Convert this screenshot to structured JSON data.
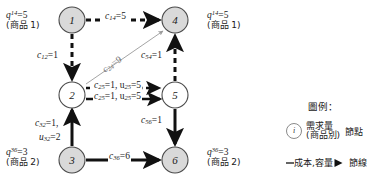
{
  "diagram": {
    "title_alt": "multi-commodity network flow diagram",
    "nodes": [
      {
        "id": "n1",
        "label": "1",
        "x": 72,
        "y": 20,
        "fill": "#d9d9d9"
      },
      {
        "id": "n4",
        "label": "4",
        "x": 175,
        "y": 20,
        "fill": "#d9d9d9"
      },
      {
        "id": "n2",
        "label": "2",
        "x": 72,
        "y": 95,
        "fill": "#ffffff"
      },
      {
        "id": "n5",
        "label": "5",
        "x": 175,
        "y": 95,
        "fill": "#ffffff"
      },
      {
        "id": "n3",
        "label": "3",
        "x": 72,
        "y": 160,
        "fill": "#d9d9d9"
      },
      {
        "id": "n6",
        "label": "6",
        "x": 175,
        "y": 160,
        "fill": "#d9d9d9"
      }
    ],
    "supplies": [
      {
        "name": "supply-1-4",
        "line1_q": "q",
        "line1_sup": "14",
        "line1_val": "=5",
        "line2": "(商品 1)",
        "x": 6,
        "y": 10
      },
      {
        "name": "supply-4-top-right",
        "line1_q": "q",
        "line1_sup": "14",
        "line1_val": "=5",
        "line2": "(商品 1)",
        "x": 207,
        "y": 10
      },
      {
        "name": "supply-3-6",
        "line1_q": "q",
        "line1_sup": "36",
        "line1_val": "=3",
        "line2": "(商品 2)",
        "x": 6,
        "y": 147
      },
      {
        "name": "supply-6-bottom-right",
        "line1_q": "q",
        "line1_sup": "36",
        "line1_val": "=3",
        "line2": "(商品 2)",
        "x": 207,
        "y": 147
      }
    ],
    "edge_labels": [
      {
        "name": "edge-label-c14",
        "text_c": "c",
        "sub": "14",
        "rest": "=5",
        "x": 104,
        "y": 12,
        "style": "horizontal"
      },
      {
        "name": "edge-label-c12",
        "text_c": "c",
        "sub": "12",
        "rest": "=1",
        "x": 38,
        "y": 52,
        "style": "vertical-left"
      },
      {
        "name": "edge-label-c24",
        "text_c": "c",
        "sub": "24",
        "rest": "=9",
        "x": 104,
        "y": 62,
        "style": "diagonal"
      },
      {
        "name": "edge-label-c25-dashed",
        "text_c": "c",
        "sub": "25",
        "rest": "=1, u",
        "sub2": "25",
        "rest2": "=5",
        "x": 92,
        "y": 82,
        "style": "horizontal"
      },
      {
        "name": "edge-label-c25-solid",
        "text_c": "c",
        "sub": "25",
        "rest": "=1, u",
        "sub2": "25",
        "rest2": "=5",
        "x": 92,
        "y": 92,
        "style": "horizontal"
      },
      {
        "name": "edge-label-c54",
        "text_c": "c",
        "sub": "54",
        "rest": "=1",
        "x": 162,
        "y": 52,
        "style": "vertical-left"
      },
      {
        "name": "edge-label-c56",
        "text_c": "c",
        "sub": "56",
        "rest": "=1",
        "x": 160,
        "y": 118,
        "style": "vertical-left"
      },
      {
        "name": "edge-label-c32",
        "text_c": "c",
        "sub": "32",
        "rest": "=1,",
        "x": 38,
        "y": 120,
        "style": "vertical-left"
      },
      {
        "name": "edge-label-u32",
        "text_c": "u",
        "sub": "32",
        "rest": "=2",
        "x": 42,
        "y": 134,
        "style": "vertical-left"
      },
      {
        "name": "edge-label-c36",
        "text_c": "c",
        "sub": "36",
        "rest": "=6",
        "x": 110,
        "y": 153,
        "style": "horizontal"
      }
    ],
    "legend": {
      "title": "圖例：",
      "node_glyph": "i",
      "node_desc_line1": "需求量",
      "node_desc_line2": "(商品別)",
      "node_term": "節點",
      "arc_desc": "成本,容量",
      "arc_term": "節線"
    }
  },
  "colors": {
    "node_fill_shaded": "#d9d9d9",
    "node_fill_plain": "#ffffff",
    "node_stroke": "#4a4a4a",
    "edge_dark": "#111111",
    "edge_gray": "#9a9a9a",
    "text": "#1a1a1a"
  }
}
